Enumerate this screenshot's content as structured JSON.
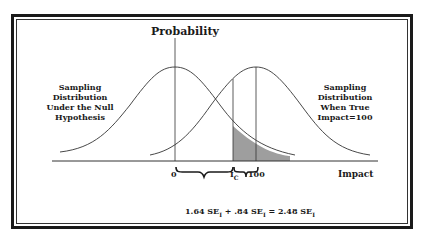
{
  "diagram": {
    "title": "Probability",
    "x_axis_label": "Impact",
    "left_curve_label": [
      "Sampling",
      "Distribution",
      "Under the Null",
      "Hypothesis"
    ],
    "right_curve_label": [
      "Sampling",
      "Distribution",
      "When True",
      "Impact=100"
    ],
    "ticks": {
      "zero": "0",
      "critical": "I",
      "critical_sub": "C",
      "hundred": "100"
    },
    "formula": {
      "term1": "1.64 SE",
      "term1_sub": "I",
      "plus": "+",
      "term2": ".84 SE",
      "term2_sub": "I",
      "equals": "=",
      "result": "2.48 SE",
      "result_sub": "I"
    },
    "colors": {
      "line": "#333333",
      "shade": "#9e9e9e",
      "border": "#1a1a1a"
    }
  }
}
